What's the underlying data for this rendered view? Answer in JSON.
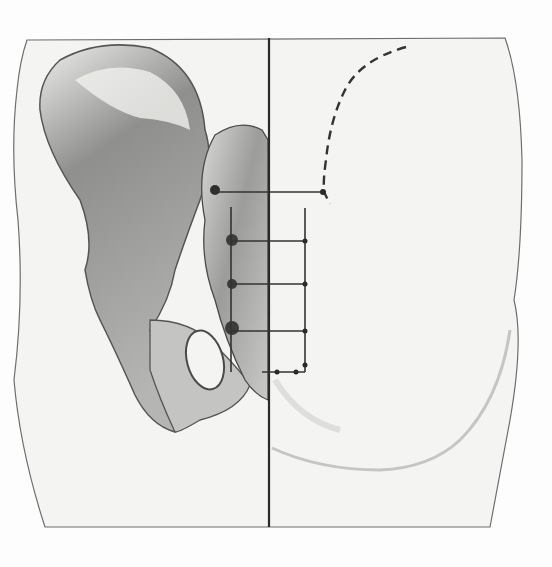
{
  "figure": {
    "colors": {
      "background": "#fdfdfd",
      "panel": "#f4f4f3",
      "outline": "#6e6e6e",
      "midline": "#2a2a2a",
      "bone_light": "#e6e6e4",
      "bone_mid": "#a9a9a7",
      "bone_dark": "#5c5c5a",
      "guide": "#333333"
    },
    "landmarks": [
      {
        "name": "iliac-crest-marker",
        "style": "dashed-curve"
      },
      {
        "name": "posterior-superior-iliac-spine-level"
      },
      {
        "name": "sacral-foramen-level-1"
      },
      {
        "name": "sacral-foramen-level-2"
      },
      {
        "name": "sacral-foramen-level-3"
      },
      {
        "name": "coccyx-level"
      }
    ]
  }
}
